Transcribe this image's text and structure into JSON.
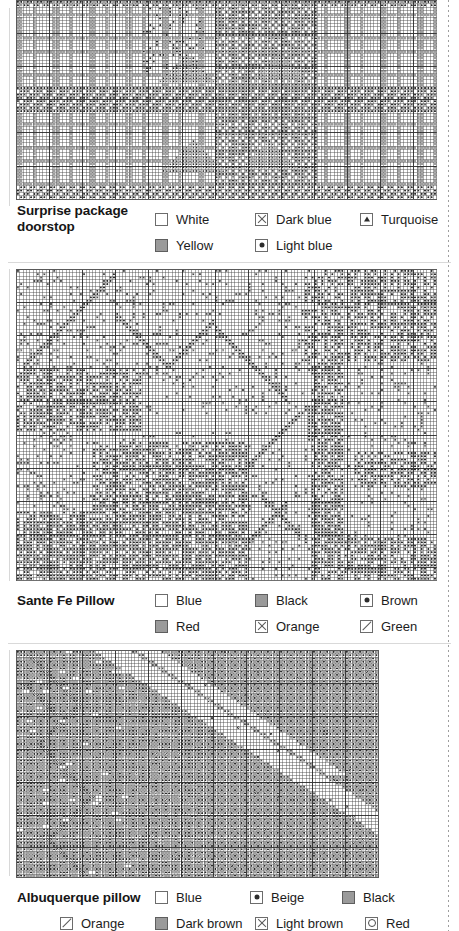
{
  "page": {
    "background": "#ffffff",
    "margin_rule_color": "#8d8d8d",
    "width": 459,
    "height": 931
  },
  "sections": [
    {
      "title": "Surprise package doorstop",
      "title_lines": [
        "Surprise package",
        "doorstop"
      ],
      "chart": {
        "x": 16,
        "y": 8,
        "w": 420,
        "h": 198,
        "cols": 127,
        "rows": 60,
        "cell": 3.31,
        "seed": 17,
        "style": "doorstop"
      },
      "legend_columns": 3,
      "legend": [
        {
          "label": "White",
          "symbol": "empty"
        },
        {
          "label": "Dark blue",
          "symbol": "cross"
        },
        {
          "label": "Turquoise",
          "symbol": "triangle"
        },
        {
          "label": "Yellow",
          "symbol": "filled"
        },
        {
          "label": "Light blue",
          "symbol": "dot"
        }
      ]
    },
    {
      "title": "Sante Fe Pillow",
      "title_lines": [
        "Sante Fe Pillow"
      ],
      "chart": {
        "x": 16,
        "y": 272,
        "w": 420,
        "h": 312,
        "cols": 127,
        "rows": 94,
        "cell": 3.31,
        "seed": 53,
        "style": "santefe"
      },
      "legend_columns": 3,
      "legend": [
        {
          "label": "Blue",
          "symbol": "empty"
        },
        {
          "label": "Black",
          "symbol": "filled"
        },
        {
          "label": "Brown",
          "symbol": "dot"
        },
        {
          "label": "Red",
          "symbol": "filled"
        },
        {
          "label": "Orange",
          "symbol": "cross"
        },
        {
          "label": "Green",
          "symbol": "slash"
        }
      ]
    },
    {
      "title": "Albuquerque pillow",
      "title_lines": [
        "Albuquerque pillow"
      ],
      "chart": {
        "x": 16,
        "y": 644,
        "w": 362,
        "h": 226,
        "cols": 110,
        "rows": 69,
        "cell": 3.29,
        "seed": 91,
        "style": "albuquerque"
      },
      "legend_columns": 4,
      "legend": [
        {
          "label": "Blue",
          "symbol": "empty"
        },
        {
          "label": "Beige",
          "symbol": "dot"
        },
        {
          "label": "Black",
          "symbol": "filled"
        },
        {
          "label": "Orange",
          "symbol": "slash"
        },
        {
          "label": "Dark brown",
          "symbol": "filled"
        },
        {
          "label": "Light brown",
          "symbol": "cross"
        },
        {
          "label": "Red",
          "symbol": "ring"
        }
      ]
    }
  ],
  "chart_data": {
    "type": "heatmap",
    "grid": true,
    "legend_position": "below-chart",
    "charts": [
      {
        "name": "Surprise package doorstop",
        "cols": 127,
        "rows": 60,
        "symbols": [
          "empty",
          "filled",
          "cross",
          "dot",
          "triangle"
        ],
        "symbol_colors": {
          "empty": "White",
          "filled": "Yellow",
          "cross": "Dark blue",
          "dot": "Light blue",
          "triangle": "Turquoise"
        },
        "palette": [
          "#ffffff",
          "#9a9a9a",
          "#6a6a6a",
          "#3d3d3d",
          "#2c2c2c"
        ]
      },
      {
        "name": "Sante Fe Pillow",
        "cols": 127,
        "rows": 94,
        "symbols": [
          "empty",
          "filled",
          "dot",
          "cross",
          "slash"
        ],
        "symbol_colors": {
          "empty": "Blue",
          "filled": "Black / Red",
          "dot": "Brown",
          "cross": "Orange",
          "slash": "Green"
        },
        "palette": [
          "#ffffff",
          "#9a9a9a",
          "#7a7a7a",
          "#525252",
          "#2f2f2f"
        ]
      },
      {
        "name": "Albuquerque pillow",
        "cols": 110,
        "rows": 69,
        "symbols": [
          "empty",
          "filled",
          "dot",
          "cross",
          "slash",
          "ring"
        ],
        "symbol_colors": {
          "empty": "Blue",
          "dot": "Beige",
          "filled": "Black / Dark brown",
          "slash": "Orange",
          "cross": "Light brown",
          "ring": "Red"
        },
        "palette": [
          "#ffffff",
          "#a0a0a0",
          "#808080",
          "#585858",
          "#333333"
        ]
      }
    ]
  }
}
